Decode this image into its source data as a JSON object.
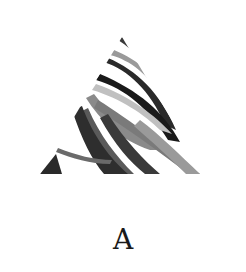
{
  "figure": {
    "logo": {
      "icon": "abstract-triangle-brushstroke-logo",
      "colors": {
        "dark": "#1e1e1e",
        "mid": "#5a5a5a",
        "light": "#8e8e8e",
        "pale": "#c4c4c4",
        "background": "#ffffff"
      }
    },
    "caption": "A"
  }
}
